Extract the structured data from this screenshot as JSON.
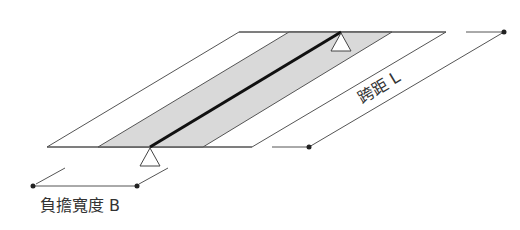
{
  "diagram": {
    "labels": {
      "load_width": "負擔寬度 B",
      "span": "跨距 L"
    },
    "colors": {
      "line": "#555555",
      "beam": "#111111",
      "band_fill": "#d9d9d9",
      "dot": "#222222"
    },
    "elements": [
      "slab",
      "load-band",
      "beam",
      "support-left",
      "support-right",
      "dimension-B",
      "dimension-L"
    ]
  }
}
